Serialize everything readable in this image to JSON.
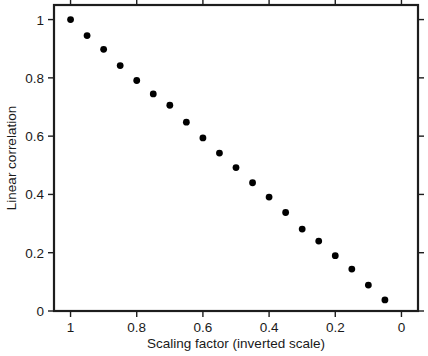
{
  "chart_data": {
    "type": "scatter",
    "title": "",
    "xlabel": "Scaling factor (inverted scale)",
    "ylabel": "Linear correlation",
    "xlim": [
      1.05,
      -0.05
    ],
    "ylim": [
      0,
      1.05
    ],
    "x_inverted": true,
    "grid": false,
    "legend": null,
    "xticks": [
      1,
      0.8,
      0.6,
      0.4,
      0.2,
      0
    ],
    "xticklabels": [
      "1",
      "0.8",
      "0.6",
      "0.4",
      "0.2",
      "0"
    ],
    "yticks": [
      0,
      0.2,
      0.4,
      0.6,
      0.8,
      1
    ],
    "yticklabels": [
      "0",
      "0.2",
      "0.4",
      "0.6",
      "0.8",
      "1"
    ],
    "marker": "filled-circle",
    "marker_color": "#000000",
    "series": [
      {
        "name": "linear correlation vs scaling factor",
        "x": [
          1.0,
          0.95,
          0.9,
          0.85,
          0.8,
          0.75,
          0.7,
          0.65,
          0.6,
          0.55,
          0.5,
          0.45,
          0.4,
          0.35,
          0.3,
          0.25,
          0.2,
          0.15,
          0.1,
          0.05
        ],
        "y": [
          1.0,
          0.945,
          0.898,
          0.842,
          0.791,
          0.745,
          0.706,
          0.648,
          0.594,
          0.542,
          0.492,
          0.44,
          0.391,
          0.338,
          0.281,
          0.24,
          0.19,
          0.144,
          0.089,
          0.038
        ]
      }
    ]
  },
  "axes": {
    "x_title": "Scaling factor (inverted scale)",
    "y_title": "Linear correlation"
  },
  "colors": {
    "frame": "#1d1d1d",
    "marker": "#000000",
    "background": "#ffffff",
    "text": "#1a1a1a"
  }
}
